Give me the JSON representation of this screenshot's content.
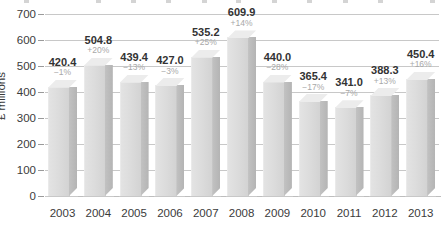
{
  "chart_data": {
    "type": "bar",
    "title": "",
    "xlabel": "",
    "ylabel": "£ millions",
    "ylim": [
      0,
      700
    ],
    "ytick_step": 100,
    "yticks": [
      "0",
      "100",
      "200",
      "300",
      "400",
      "500",
      "600",
      "700"
    ],
    "grid": true,
    "legend": "none",
    "style_3d": true,
    "categories": [
      "2003",
      "2004",
      "2005",
      "2006",
      "2007",
      "2008",
      "2009",
      "2010",
      "2011",
      "2012",
      "2013"
    ],
    "values": [
      420.4,
      504.8,
      439.4,
      427.0,
      535.2,
      609.9,
      440.0,
      365.4,
      341.0,
      388.3,
      450.4
    ],
    "value_labels": [
      "420.4",
      "504.8",
      "439.4",
      "427.0",
      "535.2",
      "609.9",
      "440.0",
      "365.4",
      "341.0",
      "388.3",
      "450.4"
    ],
    "change_labels": [
      "−1%",
      "+20%",
      "−13%",
      "−3%",
      "+25%",
      "+14%",
      "−28%",
      "−17%",
      "−7%",
      "+13%",
      "+16%"
    ],
    "change_values": [
      -1,
      20,
      -13,
      -3,
      25,
      14,
      -28,
      -17,
      -7,
      13,
      16
    ],
    "colors": {
      "bar_front": "#dcdcdc",
      "bar_side": "#b9b9b9",
      "bar_top": "#ececec",
      "gridline": "#c8c8c8",
      "value_text": "#333333",
      "change_text": "#a8a8a8",
      "axis_text": "#3b3b3b"
    }
  }
}
